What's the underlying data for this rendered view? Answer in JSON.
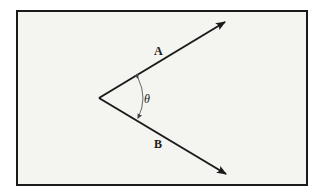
{
  "diagram": {
    "type": "angle-between-vectors",
    "background": "#f4f4f0",
    "frame_color": "#1a1a1a",
    "vertex": [
      99,
      98
    ],
    "vectors": [
      {
        "label": "A",
        "tip": [
          225,
          22
        ],
        "label_pos": [
          158,
          55
        ]
      },
      {
        "label": "B",
        "tip": [
          226,
          174
        ],
        "label_pos": [
          158,
          148
        ]
      }
    ],
    "angle": {
      "symbol": "θ",
      "label_pos": [
        146,
        103
      ]
    }
  }
}
